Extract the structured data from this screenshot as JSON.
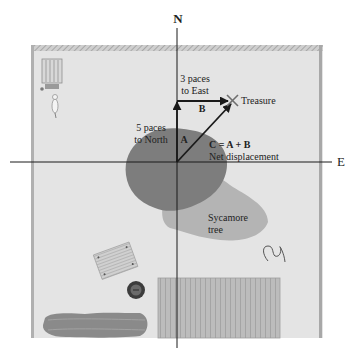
{
  "axes": {
    "north_label": "N",
    "east_label": "E"
  },
  "vectors": {
    "a": {
      "symbol": "A",
      "caption_line1": "5 paces",
      "caption_line2": "to North"
    },
    "b": {
      "symbol": "B",
      "caption_line1": "3 paces",
      "caption_line2": "to East"
    },
    "c": {
      "formula": "C = A + B",
      "caption": "Net displacement"
    }
  },
  "landmarks": {
    "treasure": "Treasure",
    "tree_line1": "Sycamore",
    "tree_line2": "tree"
  },
  "colors": {
    "background": "#ffffff",
    "yard": "#e4e4e4",
    "border": "#9c9c9c",
    "tree_dark": "#7d7d7d",
    "tree_light": "#b4b4b4",
    "hedge": "#8a8a8a",
    "deck": "#b8b8b8",
    "axis": "#1a1a1a",
    "vector": "#1a1a1a",
    "treasure_x": "#6e6e6e"
  }
}
